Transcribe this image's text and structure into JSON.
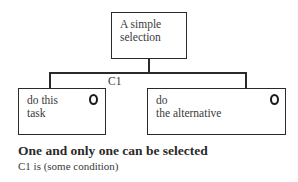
{
  "diagram": {
    "root": {
      "label": "A simple\nselection"
    },
    "condition_label": "C1",
    "children": [
      {
        "label": "do this\ntask",
        "marker": "selection-circle"
      },
      {
        "label": "do\nthe alternative",
        "marker": "selection-circle"
      }
    ]
  },
  "caption": {
    "title": "One and only one can be selected",
    "subtitle": "C1 is (some condition)"
  }
}
